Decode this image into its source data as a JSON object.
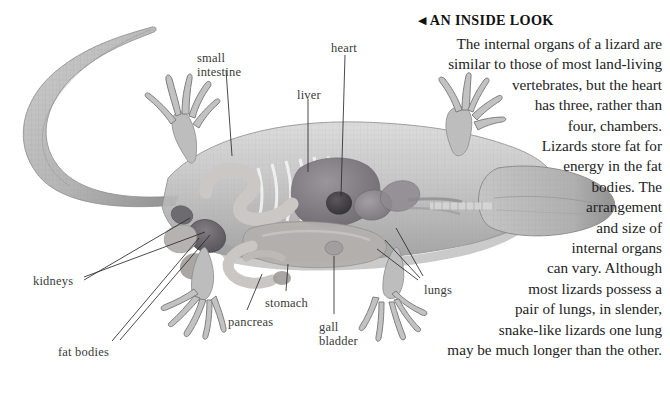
{
  "page": {
    "width": 670,
    "height": 394,
    "background": "#ffffff"
  },
  "sidebar_text": {
    "heading_marker": "◀",
    "heading": "AN INSIDE LOOK",
    "paragraph": "The internal organs of a lizard are similar to those of most land-living vertebrates, but the heart has three, rather than four, chambers. Lizards store fat for energy in the fat bodies. The arrangement and size of internal organs can vary. Although most lizards possess a pair of lungs, in slender, snake-like lizards one lung may be much longer than the other.",
    "lines": [
      "The internal organs of a lizard are",
      "similar to those of most land-living",
      "vertebrates, but the heart",
      "has three, rather than",
      "four, chambers.",
      "Lizards store fat for",
      "energy in the fat",
      "bodies. The",
      "arrangement",
      "and size of",
      "internal organs",
      "can vary. Although",
      "most lizards possess a",
      "pair of lungs, in slender,",
      "snake-like lizards one lung",
      "may be much longer than the other."
    ]
  },
  "labels": [
    {
      "id": "small-intestine",
      "text": "small\nintestine",
      "x": 197,
      "y": 51
    },
    {
      "id": "heart",
      "text": "heart",
      "x": 331,
      "y": 41
    },
    {
      "id": "liver",
      "text": "liver",
      "x": 297,
      "y": 88
    },
    {
      "id": "kidneys",
      "text": "kidneys",
      "x": 33,
      "y": 274
    },
    {
      "id": "fat-bodies",
      "text": "fat bodies",
      "x": 58,
      "y": 345
    },
    {
      "id": "stomach",
      "text": "stomach",
      "x": 265,
      "y": 296
    },
    {
      "id": "pancreas",
      "text": "pancreas",
      "x": 228,
      "y": 315
    },
    {
      "id": "gall-bladder",
      "text": "gall\nbladder",
      "x": 319,
      "y": 320
    },
    {
      "id": "lungs",
      "text": "lungs",
      "x": 424,
      "y": 283
    }
  ],
  "leader_lines": [
    {
      "from": "small-intestine",
      "points": "226,70 232,156"
    },
    {
      "from": "heart",
      "points": "345,57 340,196"
    },
    {
      "from": "liver",
      "points": "308,100 308,170"
    },
    {
      "from": "kidneys",
      "points": "82,281 205,232"
    },
    {
      "from": "kidneys2",
      "points": "82,284 196,247"
    },
    {
      "from": "fat-bodies",
      "points": "110,345 201,238"
    },
    {
      "from": "fat-bodies2",
      "points": "118,343 214,236"
    },
    {
      "from": "stomach",
      "points": "286,290 287,262"
    },
    {
      "from": "pancreas",
      "points": "245,310 262,272"
    },
    {
      "from": "gall-bladder",
      "points": "334,314 334,252"
    },
    {
      "from": "lungs",
      "points": "418,280 375,248"
    },
    {
      "from": "lungs2",
      "points": "420,278 383,241"
    },
    {
      "from": "lungs3",
      "points": "423,276 394,230"
    }
  ],
  "illustration_colors": {
    "body_outline": "#8d8d8d",
    "body_fill": "#c9c9c9",
    "scale_shade": "#a8a8a8",
    "liver": "#7f7b80",
    "heart_dark": "#4a4a4c",
    "stomach": "#aaa6a8",
    "lung": "#8e8a8e",
    "intestine": "#d3d0ce",
    "kidney": "#6f6b6e",
    "fat_body": "#b9b5b3",
    "leader_line": "#2a2a2a"
  }
}
